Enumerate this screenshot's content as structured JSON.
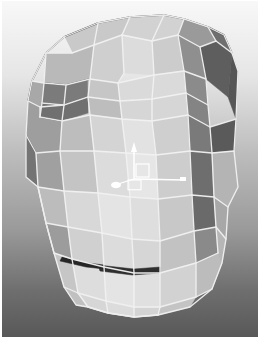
{
  "app": {
    "title": "3D Viewport",
    "window_width": 267,
    "window_height": 347
  },
  "viewport": {
    "name": "perspective-viewport",
    "x": 2,
    "y": 1,
    "width": 256,
    "height": 336,
    "background": {
      "type": "vertical-gradient",
      "top_color": "#f7f7f7",
      "mid_color": "#b9b9b9",
      "bottom_color": "#5e5e5e",
      "stops": [
        {
          "offset": 0.0,
          "color": "#f8f8f8"
        },
        {
          "offset": 0.22,
          "color": "#e6e6e6"
        },
        {
          "offset": 0.45,
          "color": "#bdbdbd"
        },
        {
          "offset": 0.68,
          "color": "#9a9a9a"
        },
        {
          "offset": 0.86,
          "color": "#6f6f6f"
        },
        {
          "offset": 1.0,
          "color": "#585858"
        }
      ]
    },
    "shading_mode": "smooth-shaded-with-wireframe",
    "wireframe_color": "#f2f2f2",
    "edge_dark_color": "#3a3a3a"
  },
  "model": {
    "name": "low-poly-head-mask",
    "description": "Low polygon head / mask mesh shown front-three-quarter",
    "face_count": 44,
    "palette": {
      "highlight": "#e8e8e8",
      "light": "#d8d8d8",
      "mid_light": "#c6c6c6",
      "mid": "#b0b0b0",
      "mid_dark": "#989898",
      "dark": "#7e7e7e",
      "darker": "#6a6a6a",
      "shadow": "#5a5a5a",
      "deep_shadow": "#4a4a4a"
    },
    "faces": [
      {
        "id": "crown-top-left",
        "fill": "#c9c9c9",
        "points": "62,36 96,22 128,16 120,34 92,44 70,52"
      },
      {
        "id": "crown-top-mid",
        "fill": "#d2d2d2",
        "points": "128,16 162,14 182,18 176,34 150,40 120,34"
      },
      {
        "id": "crown-top-right",
        "fill": "#9a9a9a",
        "points": "182,18 206,26 214,40 198,46 176,34"
      },
      {
        "id": "crown-bevel-right",
        "fill": "#6f6f6f",
        "points": "206,26 222,34 230,52 214,40"
      },
      {
        "id": "forehead-left-outer",
        "fill": "#b9b9b9",
        "points": "44,52 70,52 92,44 88,78 64,84 42,82"
      },
      {
        "id": "forehead-left",
        "fill": "#cfcfcf",
        "points": "92,44 120,34 122,72 116,82 88,78"
      },
      {
        "id": "forehead-center",
        "fill": "#dcdcdc",
        "points": "120,34 150,40 152,74 122,72"
      },
      {
        "id": "forehead-right",
        "fill": "#cccccc",
        "points": "150,40 176,34 182,70 152,74"
      },
      {
        "id": "temple-right",
        "fill": "#8f8f8f",
        "points": "176,34 198,46 204,78 182,70"
      },
      {
        "id": "side-right-upper",
        "fill": "#5e5e5e",
        "points": "198,46 214,40 230,52 226,96 204,78"
      },
      {
        "id": "side-right-band",
        "fill": "#565656",
        "points": "230,52 236,70 234,118 226,96"
      },
      {
        "id": "cheekbone-left-outer",
        "fill": "#a8a8a8",
        "points": "30,80 42,82 64,84 62,104 38,106 26,100"
      },
      {
        "id": "brow-left-dark",
        "fill": "#7b7b7b",
        "points": "42,82 64,84 88,78 86,96 62,104 40,102"
      },
      {
        "id": "brow-left-dark-2",
        "fill": "#707070",
        "points": "40,102 62,104 86,96 86,112 60,120 38,116"
      },
      {
        "id": "brow-left-light",
        "fill": "#c6c6c6",
        "points": "86,78 116,82 118,100 86,96"
      },
      {
        "id": "brow-center",
        "fill": "#dadada",
        "points": "116,82 152,74 182,70 184,92 150,98 118,100"
      },
      {
        "id": "brow-right-shadow",
        "fill": "#8b8b8b",
        "points": "182,70 204,78 206,104 184,92"
      },
      {
        "id": "eye-band-left",
        "fill": "#bdbdbd",
        "points": "86,96 118,100 120,118 88,114"
      },
      {
        "id": "eye-band-center",
        "fill": "#d6d6d6",
        "points": "118,100 150,98 184,92 186,114 150,120 120,118"
      },
      {
        "id": "eye-band-right",
        "fill": "#848484",
        "points": "184,92 206,104 208,126 186,114"
      },
      {
        "id": "cheek-left-outer",
        "fill": "#9e9e9e",
        "points": "26,100 38,106 38,116 60,120 58,150 34,152 24,134"
      },
      {
        "id": "cheek-left",
        "fill": "#bdbdbd",
        "points": "60,120 88,114 92,150 58,150"
      },
      {
        "id": "nose-left",
        "fill": "#d4d4d4",
        "points": "88,114 120,118 124,152 92,150"
      },
      {
        "id": "nose-center",
        "fill": "#e2e2e2",
        "points": "120,118 150,120 154,154 124,152"
      },
      {
        "id": "nose-right",
        "fill": "#cfcfcf",
        "points": "150,120 186,114 188,150 154,154"
      },
      {
        "id": "cheek-right-dark",
        "fill": "#7a7a7a",
        "points": "186,114 208,126 210,152 188,150"
      },
      {
        "id": "jaw-side-right",
        "fill": "#5a5a5a",
        "points": "208,126 234,118 232,150 210,152"
      },
      {
        "id": "cheek-left-lower",
        "fill": "#747474",
        "points": "24,134 34,152 36,186 24,176"
      },
      {
        "id": "cheek-left-lower-2",
        "fill": "#a0a0a0",
        "points": "34,152 58,150 62,190 36,186"
      },
      {
        "id": "mid-face-left",
        "fill": "#c4c4c4",
        "points": "58,150 92,150 96,192 62,190"
      },
      {
        "id": "mid-face-center-left",
        "fill": "#dcdcdc",
        "points": "92,150 124,152 128,196 96,192"
      },
      {
        "id": "mid-face-center",
        "fill": "#e6e6e6",
        "points": "124,152 154,154 156,198 128,196"
      },
      {
        "id": "mid-face-right",
        "fill": "#cdcdcd",
        "points": "154,154 188,150 190,194 156,198"
      },
      {
        "id": "jaw-right-dark",
        "fill": "#6e6e6e",
        "points": "188,150 210,152 212,196 190,194"
      },
      {
        "id": "jaw-right-outer",
        "fill": "#b4b4b4",
        "points": "210,152 232,150 236,186 226,206 212,196"
      },
      {
        "id": "mouth-left",
        "fill": "#bcbcbc",
        "points": "36,186 62,190 66,226 44,222"
      },
      {
        "id": "mouth-center-left",
        "fill": "#d8d8d8",
        "points": "62,190 96,192 100,232 66,226"
      },
      {
        "id": "mouth-center",
        "fill": "#e4e4e4",
        "points": "96,192 128,196 130,238 100,232"
      },
      {
        "id": "mouth-center-right",
        "fill": "#dedede",
        "points": "128,196 156,198 158,240 130,238"
      },
      {
        "id": "mouth-right",
        "fill": "#c8c8c8",
        "points": "156,198 190,194 192,230 158,240"
      },
      {
        "id": "jaw-right-shadow",
        "fill": "#6a6a6a",
        "points": "190,194 212,196 214,226 192,230"
      },
      {
        "id": "jaw-right-lower",
        "fill": "#a8a8a8",
        "points": "212,196 226,206 224,238 214,226"
      },
      {
        "id": "chin-left-side",
        "fill": "#9c9c9c",
        "points": "44,222 66,226 70,258 52,252"
      },
      {
        "id": "chin-left",
        "fill": "#d0d0d0",
        "points": "66,226 100,232 102,266 70,258"
      },
      {
        "id": "chin-center-left",
        "fill": "#dcdcdc",
        "points": "100,232 130,238 132,272 102,266"
      },
      {
        "id": "chin-center-right",
        "fill": "#d6d6d6",
        "points": "130,238 158,240 158,272 132,272"
      },
      {
        "id": "chin-right",
        "fill": "#c2c2c2",
        "points": "158,240 192,230 194,262 158,272"
      },
      {
        "id": "chin-right-dark",
        "fill": "#8a8a8a",
        "points": "192,230 214,226 216,252 194,262"
      },
      {
        "id": "neck-right",
        "fill": "#b6b6b6",
        "points": "214,226 224,238 220,262 216,252"
      },
      {
        "id": "under-chin-left",
        "fill": "#c6c6c6",
        "points": "52,252 70,258 76,292 62,286"
      },
      {
        "id": "under-chin-1",
        "fill": "#dddddd",
        "points": "70,258 102,266 104,300 76,292"
      },
      {
        "id": "under-chin-2",
        "fill": "#e4e4e4",
        "points": "102,266 132,272 132,306 104,300"
      },
      {
        "id": "under-chin-3",
        "fill": "#e0e0e0",
        "points": "132,272 158,272 158,306 132,306"
      },
      {
        "id": "under-chin-4",
        "fill": "#d2d2d2",
        "points": "158,272 194,262 194,296 158,306"
      },
      {
        "id": "under-chin-right",
        "fill": "#bcbcbc",
        "points": "194,262 216,252 220,262 210,288 194,296"
      },
      {
        "id": "bottom-left-tip",
        "fill": "#c0c0c0",
        "points": "62,286 76,292 86,306 74,304"
      },
      {
        "id": "bottom-cap-1",
        "fill": "#d6d6d6",
        "points": "76,292 104,300 106,312 86,306"
      },
      {
        "id": "bottom-cap-2",
        "fill": "#dcdcdc",
        "points": "104,300 132,306 132,316 106,312"
      },
      {
        "id": "bottom-cap-3",
        "fill": "#d4d4d4",
        "points": "132,306 158,306 156,314 132,316"
      },
      {
        "id": "bottom-cap-4",
        "fill": "#c4c4c4",
        "points": "158,306 194,296 188,306 156,314"
      },
      {
        "id": "lip-shadow",
        "fill": "#2f2f2f",
        "points": "96,264 132,268 158,266 158,272 130,274 98,270"
      },
      {
        "id": "mouth-dark-slit",
        "fill": "#262626",
        "points": "60,256 86,262 102,264 102,268 84,266 58,260"
      }
    ],
    "wire_edges": [
      "M62,36 L96,22 L128,16 L162,14 L182,18 L206,26 L222,34 L230,52 L236,70 L234,118 L232,150 L236,186 L226,206 L224,238 L220,262 L210,288 L188,306 L156,314 L132,316 L106,312 L86,306 L74,304 L62,286 L52,252 L44,222 L36,186 L24,176 L24,134 L26,100 L30,80 L44,52 L62,36",
      "M120,34 L92,44 L70,52 L44,52",
      "M120,34 L150,40 L176,34 L182,18",
      "M176,34 L198,46 L214,40 L206,26",
      "M198,46 L204,78 L206,104 L208,126 L210,152 L212,196 L214,226 L216,252",
      "M214,40 L230,52",
      "M42,82 L64,84 L88,78 L116,82 L152,74 L182,70 L204,78",
      "M88,78 L92,44",
      "M116,82 L122,72 L120,34",
      "M152,74 L150,40",
      "M182,70 L176,34",
      "M40,102 L62,104 L86,96 L118,100 L150,98 L184,92 L206,104",
      "M64,84 L62,104",
      "M88,78 L86,96",
      "M116,82 L118,100",
      "M152,74 L150,98",
      "M182,70 L184,92",
      "M38,116 L60,120 L88,114 L120,118 L150,120 L186,114 L208,126",
      "M62,104 L60,120",
      "M86,96 L88,114",
      "M118,100 L120,118",
      "M150,98 L150,120",
      "M184,92 L186,114",
      "M34,152 L58,150 L92,150 L124,152 L154,154 L188,150 L210,152",
      "M60,120 L58,150",
      "M88,114 L92,150",
      "M120,118 L124,152",
      "M150,120 L154,154",
      "M186,114 L188,150",
      "M208,126 L234,118",
      "M36,186 L62,190 L96,192 L128,196 L156,198 L190,194 L212,196",
      "M58,150 L62,190",
      "M92,150 L96,192",
      "M124,152 L128,196",
      "M154,154 L156,198",
      "M188,150 L190,194",
      "M210,152 L232,150",
      "M44,222 L66,226 L100,232 L130,238 L158,240 L192,230 L214,226",
      "M62,190 L66,226",
      "M96,192 L100,232",
      "M128,196 L130,238",
      "M156,198 L158,240",
      "M190,194 L192,230",
      "M212,196 L226,206",
      "M52,252 L70,258 L102,266 L132,272 L158,272 L194,262 L216,252",
      "M66,226 L70,258",
      "M100,232 L102,266",
      "M130,238 L132,272",
      "M158,240 L158,272",
      "M192,230 L194,262",
      "M214,226 L224,238",
      "M62,286 L76,292 L104,300 L132,306 L158,306 L194,296 L210,288",
      "M70,258 L76,292",
      "M102,266 L104,300",
      "M132,272 L132,306",
      "M158,272 L158,306",
      "M194,262 L194,296",
      "M86,306 L106,312 L132,316 L156,314",
      "M76,292 L86,306",
      "M104,300 L106,312",
      "M132,306 L132,316",
      "M158,306 L156,314",
      "M24,134 L34,152 L36,186 L44,222 L52,252",
      "M26,100 L38,106 L38,116",
      "M30,80 L42,82 L40,102 L38,116",
      "M38,106 L62,104",
      "M44,52 L42,82",
      "M62,36 L70,52",
      "M96,22 L92,44",
      "M128,16 L120,34",
      "M162,14 L150,40"
    ],
    "dark_edges": [
      "M62,36 L96,22 L128,16 L162,14 L182,18 L206,26 L222,34 L230,52",
      "M42,82 L64,84 L88,78",
      "M40,102 L62,104 L86,96",
      "M38,116 L60,120",
      "M24,134 L34,152",
      "M26,100 L30,80 L44,52 L62,36"
    ]
  },
  "gizmo": {
    "name": "transform-gizmo",
    "type": "translate-manipulator",
    "origin": {
      "x": 132,
      "y": 178
    },
    "color": "#ffffff",
    "axes": [
      {
        "id": "y-axis",
        "label": "Y",
        "direction": "up",
        "length": 34,
        "handle": "arrow"
      },
      {
        "id": "x-axis",
        "label": "X",
        "direction": "right",
        "length": 50,
        "handle": "tick"
      },
      {
        "id": "z-axis",
        "label": "Z",
        "direction": "left-down",
        "length": 16,
        "handle": "ellipse"
      }
    ],
    "center_handle": {
      "id": "plane-handle",
      "shape": "square",
      "size": 13
    }
  }
}
